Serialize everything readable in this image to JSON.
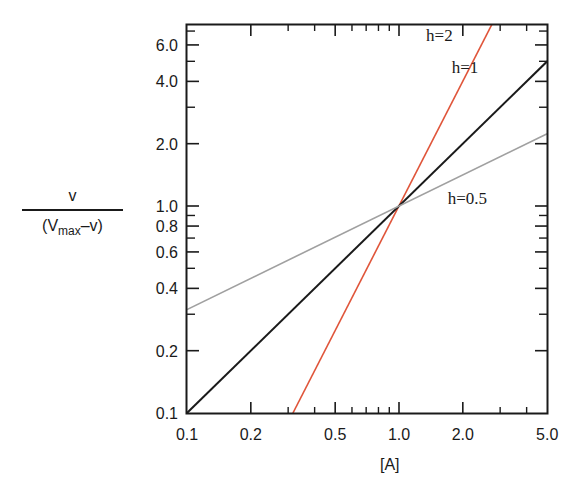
{
  "chart_data": {
    "type": "line",
    "title": "",
    "xlabel": "[A]",
    "ylabel": {
      "numerator": "v",
      "denominator_prefix": "(V",
      "denominator_sub": "max",
      "denominator_suffix": "–v)"
    },
    "xscale": "log",
    "yscale": "log",
    "xlim": [
      0.1,
      5.0
    ],
    "ylim": [
      0.1,
      7.8
    ],
    "grid": false,
    "x_ticks": [
      {
        "value": 0.1,
        "label": "0.1"
      },
      {
        "value": 0.2,
        "label": "0.2"
      },
      {
        "value": 0.5,
        "label": "0.5"
      },
      {
        "value": 1.0,
        "label": "1.0"
      },
      {
        "value": 2.0,
        "label": "2.0"
      },
      {
        "value": 5.0,
        "label": "5.0"
      }
    ],
    "x_minor_ticks": [
      0.3,
      0.4,
      0.6,
      0.7,
      0.8,
      0.9,
      3,
      4
    ],
    "y_ticks": [
      {
        "value": 0.1,
        "label": "0.1"
      },
      {
        "value": 0.2,
        "label": "0.2"
      },
      {
        "value": 0.4,
        "label": "0.4"
      },
      {
        "value": 0.6,
        "label": "0.6"
      },
      {
        "value": 0.8,
        "label": "0.8"
      },
      {
        "value": 1.0,
        "label": "1.0"
      },
      {
        "value": 2.0,
        "label": "2.0"
      },
      {
        "value": 4.0,
        "label": "4.0"
      },
      {
        "value": 6.0,
        "label": "6.0"
      }
    ],
    "y_minor_ticks": [
      0.3,
      0.5,
      0.7,
      0.9,
      3,
      5,
      7
    ],
    "series": [
      {
        "name": "h=2",
        "hill_coefficient": 2,
        "color": "#e0553a",
        "x": [
          0.316,
          2.79
        ],
        "y": [
          0.1,
          7.8
        ],
        "label_pos": {
          "x": 1.55,
          "y": 6.3
        }
      },
      {
        "name": "h=1",
        "hill_coefficient": 1,
        "color": "#1a1a1a",
        "x": [
          0.1,
          5.0
        ],
        "y": [
          0.1,
          5.0
        ],
        "label_pos": {
          "x": 2.05,
          "y": 4.4
        }
      },
      {
        "name": "h=0.5",
        "hill_coefficient": 0.5,
        "color": "#a0a0a0",
        "x": [
          0.1,
          5.0
        ],
        "y": [
          0.316,
          2.236
        ],
        "label_pos": {
          "x": 2.1,
          "y": 1.02
        }
      }
    ],
    "legend": "inline labels near lines"
  }
}
